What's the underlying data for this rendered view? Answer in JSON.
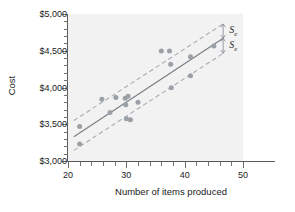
{
  "chart_data": {
    "type": "scatter",
    "title": "",
    "xlabel": "Number of items produced",
    "ylabel": "Cost",
    "xlim": [
      20,
      50
    ],
    "ylim": [
      3000,
      5000
    ],
    "grid": false,
    "legend": null,
    "x_ticks": [
      20,
      30,
      40,
      50
    ],
    "x_tick_labels": [
      "20",
      "30",
      "40",
      "50"
    ],
    "x_minor_step": 2,
    "y_ticks": [
      3000,
      3500,
      4000,
      4500,
      5000
    ],
    "y_tick_labels": [
      "$3,000",
      "$3,500",
      "$4,000",
      "$4,500",
      "$5,000"
    ],
    "y_minor_step": 100,
    "points": [
      {
        "x": 22.0,
        "y": 3470
      },
      {
        "x": 22.0,
        "y": 3230
      },
      {
        "x": 25.8,
        "y": 3840
      },
      {
        "x": 27.2,
        "y": 3660
      },
      {
        "x": 28.2,
        "y": 3865
      },
      {
        "x": 29.8,
        "y": 3855
      },
      {
        "x": 29.9,
        "y": 3765
      },
      {
        "x": 30.3,
        "y": 3880
      },
      {
        "x": 30.0,
        "y": 3575
      },
      {
        "x": 30.7,
        "y": 3560
      },
      {
        "x": 32.0,
        "y": 3800
      },
      {
        "x": 36.0,
        "y": 4495
      },
      {
        "x": 37.4,
        "y": 4495
      },
      {
        "x": 37.6,
        "y": 4315
      },
      {
        "x": 37.7,
        "y": 3995
      },
      {
        "x": 41.0,
        "y": 4420
      },
      {
        "x": 41.0,
        "y": 4160
      },
      {
        "x": 45.0,
        "y": 4565
      }
    ],
    "regression_line": {
      "name": "least-squares regression line",
      "style": "solid",
      "x_start": 21.0,
      "y_start": 3330,
      "x_end": 46.6,
      "y_end": 4670
    },
    "upper_band": {
      "name": "upper standard-error band",
      "style": "dashed",
      "x_start": 21.0,
      "y_start": 3550,
      "x_end": 46.6,
      "y_end": 4865
    },
    "lower_band": {
      "name": "lower standard-error band",
      "style": "dashed",
      "x_start": 21.0,
      "y_start": 3145,
      "x_end": 46.6,
      "y_end": 4465
    },
    "annotations": [
      {
        "label": "Se",
        "symbol": "S",
        "subscript": "e",
        "x": 46.6,
        "y_from": 4670,
        "y_to": 4865
      },
      {
        "label": "Se",
        "symbol": "S",
        "subscript": "e",
        "x": 46.6,
        "y_from": 4465,
        "y_to": 4670
      }
    ]
  }
}
